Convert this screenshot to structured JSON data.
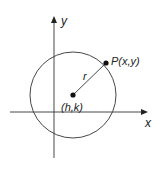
{
  "diagram": {
    "axes": {
      "x_label": "x",
      "y_label": "y"
    },
    "center_label": "(h,k)",
    "point_label": "P(x,y)",
    "radius_label": "r",
    "colors": {
      "stroke": "#333333",
      "point": "#111111",
      "background": "#ffffff"
    }
  }
}
